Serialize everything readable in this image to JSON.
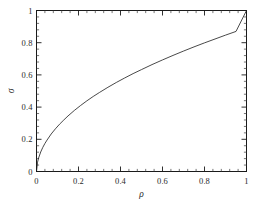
{
  "chart_data": {
    "type": "line",
    "title": "",
    "subtitle": "",
    "xlabel": "ρ",
    "ylabel": "σ",
    "xlim": [
      0,
      1
    ],
    "ylim": [
      0,
      1
    ],
    "grid": false,
    "legend": null,
    "legend_position": "none",
    "xticks": [
      0,
      0.2,
      0.4,
      0.6,
      0.8,
      1
    ],
    "xticklabels": [
      "0",
      "0.2",
      "0.4",
      "0.6",
      "0.8",
      "1"
    ],
    "yticks": [
      0,
      0.2,
      0.4,
      0.6,
      0.8,
      1
    ],
    "yticklabels": [
      "0",
      "0.2",
      "0.4",
      "0.6",
      "0.8",
      "1"
    ],
    "minor_ticks_per_interval": 4,
    "line_color": "#1a1a1a",
    "line_width": 0.8,
    "frame_color": "#1a1a1a",
    "background_color": "#ffffff",
    "series": [
      {
        "name": "sigma_vs_rho",
        "x": [
          0,
          0.005,
          0.01,
          0.02,
          0.03,
          0.04,
          0.05,
          0.07,
          0.09,
          0.11,
          0.13,
          0.15,
          0.18,
          0.21,
          0.24,
          0.27,
          0.3,
          0.34,
          0.38,
          0.42,
          0.46,
          0.5,
          0.55,
          0.6,
          0.65,
          0.7,
          0.75,
          0.8,
          0.85,
          0.9,
          0.95,
          1
        ],
        "y": [
          0,
          0.058,
          0.084,
          0.121,
          0.15,
          0.174,
          0.195,
          0.233,
          0.265,
          0.294,
          0.32,
          0.345,
          0.379,
          0.41,
          0.439,
          0.466,
          0.491,
          0.523,
          0.553,
          0.581,
          0.608,
          0.633,
          0.664,
          0.693,
          0.721,
          0.748,
          0.774,
          0.799,
          0.823,
          0.847,
          0.87,
          1
        ]
      }
    ]
  },
  "axes": {
    "x_label": "ρ",
    "y_label": "σ",
    "x_tick_labels": [
      "0",
      "0.2",
      "0.4",
      "0.6",
      "0.8",
      "1"
    ],
    "y_tick_labels": [
      "0",
      "0.2",
      "0.4",
      "0.6",
      "0.8",
      "1"
    ]
  }
}
